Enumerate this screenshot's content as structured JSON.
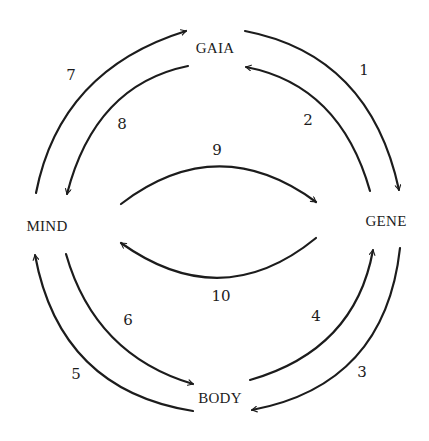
{
  "diagram": {
    "type": "cycle",
    "nodes": [
      {
        "id": "gaia",
        "label": "GAIA"
      },
      {
        "id": "mind",
        "label": "MIND"
      },
      {
        "id": "gene",
        "label": "GENE"
      },
      {
        "id": "body",
        "label": "BODY"
      }
    ],
    "edges": [
      {
        "label": "1",
        "from": "GAIA",
        "to": "GENE"
      },
      {
        "label": "2",
        "from": "GENE",
        "to": "GAIA"
      },
      {
        "label": "3",
        "from": "GENE",
        "to": "BODY"
      },
      {
        "label": "4",
        "from": "BODY",
        "to": "GENE"
      },
      {
        "label": "5",
        "from": "BODY",
        "to": "MIND"
      },
      {
        "label": "6",
        "from": "MIND",
        "to": "BODY"
      },
      {
        "label": "7",
        "from": "MIND",
        "to": "GAIA"
      },
      {
        "label": "8",
        "from": "GAIA",
        "to": "MIND"
      },
      {
        "label": "9",
        "from": "MIND",
        "to": "GENE"
      },
      {
        "label": "10",
        "from": "GENE",
        "to": "MIND"
      }
    ],
    "stroke_color": "#1c1c1c",
    "background": "#ffffff"
  }
}
